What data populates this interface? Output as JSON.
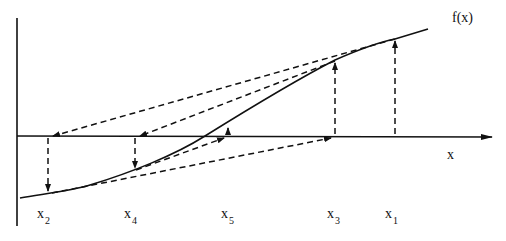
{
  "diagram": {
    "function_label": "f(x)",
    "axis_label_x": "x",
    "points": [
      {
        "name": "x1",
        "base": "x",
        "sub": "1"
      },
      {
        "name": "x2",
        "base": "x",
        "sub": "2"
      },
      {
        "name": "x3",
        "base": "x",
        "sub": "3"
      },
      {
        "name": "x4",
        "base": "x",
        "sub": "4"
      },
      {
        "name": "x5",
        "base": "x",
        "sub": "5"
      }
    ],
    "colors": {
      "line": "#111111",
      "background": "#ffffff"
    }
  }
}
